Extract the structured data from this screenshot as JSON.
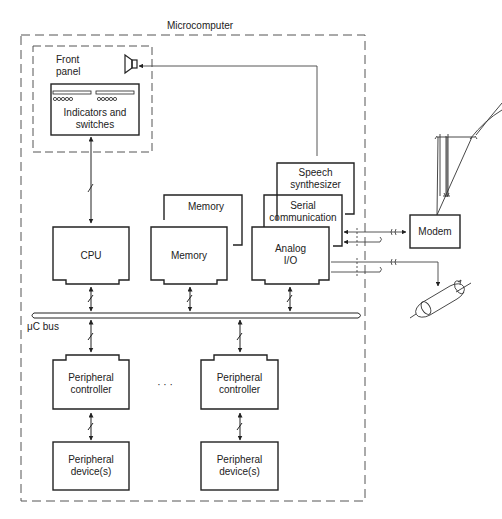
{
  "diagram": {
    "title": "Microcomputer",
    "front_panel": {
      "label": "Front\npanel",
      "indicators": "Indicators and\nswitches"
    },
    "blocks": {
      "cpu": "CPU",
      "memory_back": "Memory",
      "memory_front": "Memory",
      "speech": "Speech\nsynthesizer",
      "serial": "Serial\ncommunication",
      "analog": "Analog\nI/O",
      "modem": "Modem",
      "periph_ctrl_1": "Peripheral\ncontroller",
      "periph_ctrl_2": "Peripheral\ncontroller",
      "periph_dev_1": "Peripheral\ndevice(s)",
      "periph_dev_2": "Peripheral\ndevice(s)"
    },
    "bus_label": "μC bus",
    "ellipsis": "· · ·",
    "icons": [
      "speaker-icon",
      "telephone-pole-icon",
      "motor-shaft-icon"
    ],
    "colors": {
      "stroke": "#222222",
      "dash": "#555555",
      "background": "#ffffff"
    }
  }
}
